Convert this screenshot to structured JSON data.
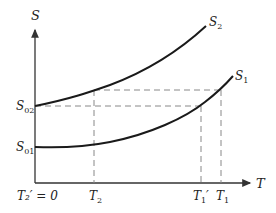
{
  "diagram": {
    "axes": {
      "y_label": "S",
      "x_label": "T"
    },
    "y_ticks": [
      {
        "id": "S02",
        "main": "S",
        "sub": "02"
      },
      {
        "id": "S01",
        "main": "S",
        "sub": "01"
      }
    ],
    "x_ticks": [
      {
        "id": "T2prime",
        "text": "T₂′ = 0"
      },
      {
        "id": "T2",
        "main": "T",
        "sub": "2"
      },
      {
        "id": "T1prime",
        "main": "T",
        "sub": "1",
        "prime": "′"
      },
      {
        "id": "T1",
        "main": "T",
        "sub": "1"
      }
    ],
    "curves": [
      {
        "id": "S2",
        "main": "S",
        "sub": "2"
      },
      {
        "id": "S1",
        "main": "S",
        "sub": "1"
      }
    ],
    "colors": {
      "curve": "#1a1a1a",
      "axis": "#333333",
      "dashed": "#888888"
    }
  }
}
